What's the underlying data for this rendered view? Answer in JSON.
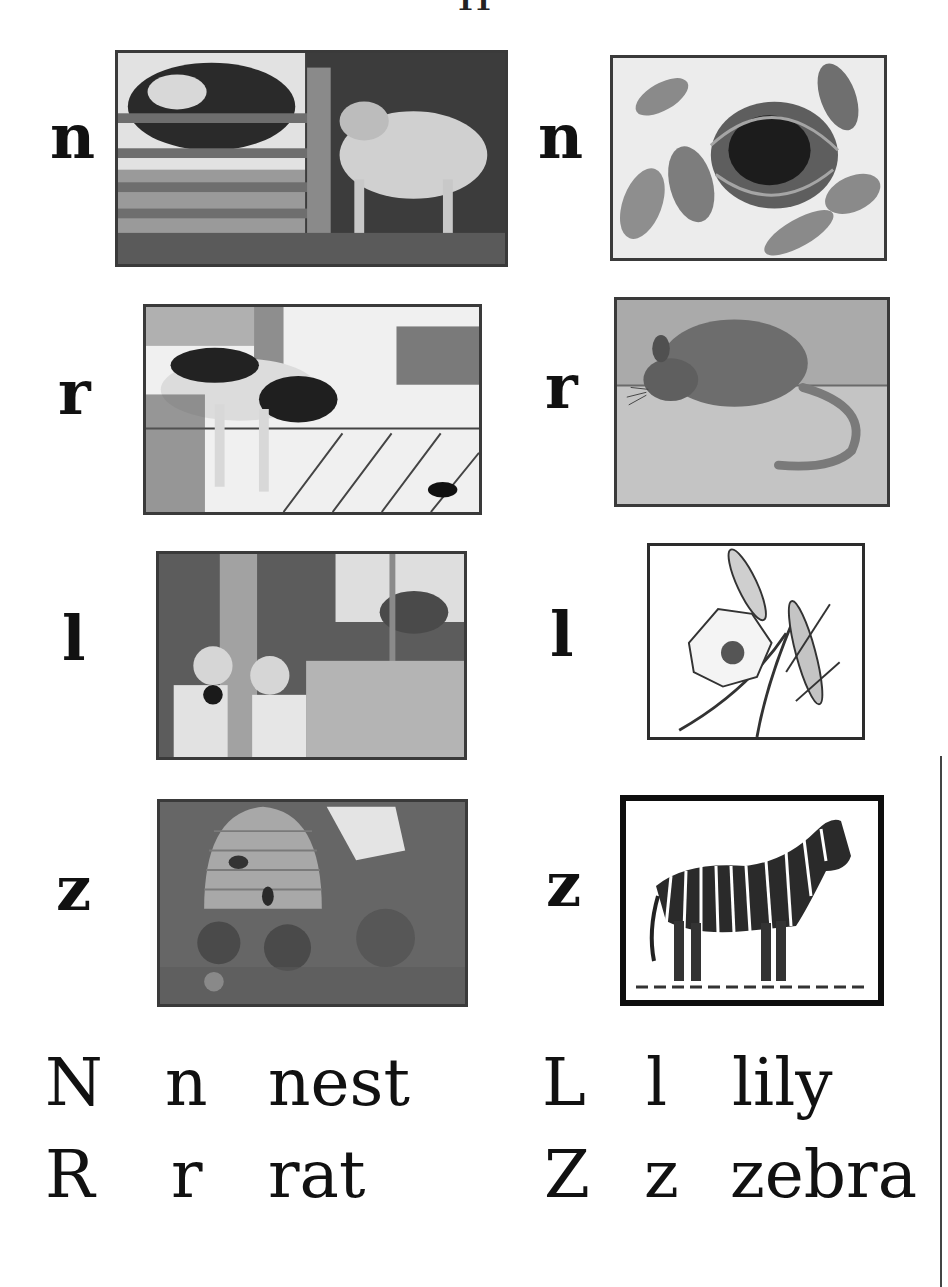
{
  "page": {
    "page_number": "11",
    "background": "#ffffff",
    "ink": "#111111"
  },
  "pictures": [
    {
      "id": "calf",
      "letter": "n",
      "column": "left",
      "row": 1,
      "subject": "cow and calf by fence"
    },
    {
      "id": "nest",
      "letter": "n",
      "column": "right",
      "row": 1,
      "subject": "bird nest in leaves"
    },
    {
      "id": "dog",
      "letter": "r",
      "column": "left",
      "row": 2,
      "subject": "dog chasing rat"
    },
    {
      "id": "rat",
      "letter": "r",
      "column": "right",
      "row": 2,
      "subject": "rat"
    },
    {
      "id": "children",
      "letter": "l",
      "column": "left",
      "row": 3,
      "subject": "children by tree"
    },
    {
      "id": "lily",
      "letter": "l",
      "column": "right",
      "row": 3,
      "subject": "lily flower"
    },
    {
      "id": "beehive",
      "letter": "z",
      "column": "left",
      "row": 4,
      "subject": "beehive in garden"
    },
    {
      "id": "zebra",
      "letter": "z",
      "column": "right",
      "row": 4,
      "subject": "zebra"
    }
  ],
  "word_table": [
    {
      "upper": "N",
      "lower": "n",
      "word": "nest"
    },
    {
      "upper": "L",
      "lower": "l",
      "word": "lily"
    },
    {
      "upper": "R",
      "lower": "r",
      "word": "rat"
    },
    {
      "upper": "Z",
      "lower": "z",
      "word": "zebra"
    }
  ]
}
